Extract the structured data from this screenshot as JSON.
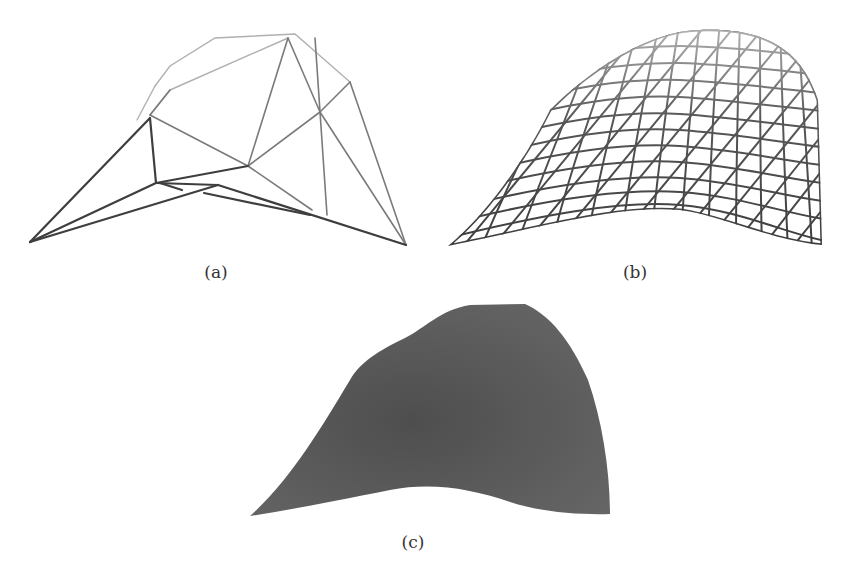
{
  "figure": {
    "subfigures": [
      {
        "id": "a",
        "label": "(a)",
        "description": "coarse triangulated wireframe surface"
      },
      {
        "id": "b",
        "label": "(b)",
        "description": "refined triangulated wireframe mesh"
      },
      {
        "id": "c",
        "label": "(c)",
        "description": "shaded smooth surface"
      }
    ]
  },
  "colors": {
    "background": "#ffffff",
    "wire_dark": "#3a3a3a",
    "wire_light": "#9a9a9a",
    "surface": "#5c5c5c",
    "caption_text": "#333333"
  }
}
